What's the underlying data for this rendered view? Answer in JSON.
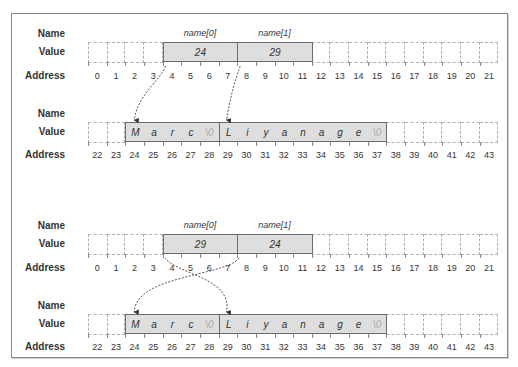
{
  "labels": {
    "name": "Name",
    "value": "Value",
    "address": "Address"
  },
  "panels": [
    {
      "id": "before",
      "array": {
        "names": [
          "name[0]",
          "name[1]"
        ],
        "values": [
          "24",
          "29"
        ],
        "addresses": [
          "0",
          "1",
          "2",
          "3",
          "4",
          "5",
          "6",
          "7",
          "8",
          "9",
          "10",
          "11",
          "12",
          "13",
          "14",
          "15",
          "16",
          "17",
          "18",
          "19",
          "20",
          "21"
        ]
      },
      "strings": {
        "chars": [
          "M",
          "a",
          "r",
          "c",
          "\\0",
          "L",
          "i",
          "y",
          "a",
          "n",
          "a",
          "g",
          "e",
          "\\0"
        ],
        "addresses": [
          "22",
          "23",
          "24",
          "25",
          "26",
          "27",
          "28",
          "29",
          "30",
          "31",
          "32",
          "33",
          "34",
          "35",
          "36",
          "37",
          "38",
          "39",
          "40",
          "41",
          "42",
          "43"
        ]
      },
      "pointers": [
        {
          "from": "name[0]",
          "to": "24"
        },
        {
          "from": "name[1]",
          "to": "29"
        }
      ]
    },
    {
      "id": "after",
      "array": {
        "names": [
          "name[0]",
          "name[1]"
        ],
        "values": [
          "29",
          "24"
        ],
        "addresses": [
          "0",
          "1",
          "2",
          "3",
          "4",
          "5",
          "6",
          "7",
          "8",
          "9",
          "10",
          "11",
          "12",
          "13",
          "14",
          "15",
          "16",
          "17",
          "18",
          "19",
          "20",
          "21"
        ]
      },
      "strings": {
        "chars": [
          "M",
          "a",
          "r",
          "c",
          "\\0",
          "L",
          "i",
          "y",
          "a",
          "n",
          "a",
          "g",
          "e",
          "\\0"
        ],
        "addresses": [
          "22",
          "23",
          "24",
          "25",
          "26",
          "27",
          "28",
          "29",
          "30",
          "31",
          "32",
          "33",
          "34",
          "35",
          "36",
          "37",
          "38",
          "39",
          "40",
          "41",
          "42",
          "43"
        ]
      },
      "pointers": [
        {
          "from": "name[0]",
          "to": "29"
        },
        {
          "from": "name[1]",
          "to": "24"
        }
      ]
    }
  ]
}
